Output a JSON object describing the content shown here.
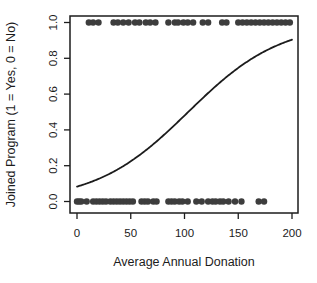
{
  "chart_data": {
    "type": "scatter",
    "title": "",
    "xlabel": "Average Annual Donation",
    "ylabel": "Joined Program (1 = Yes, 0 = No)",
    "xlim": [
      0,
      200
    ],
    "ylim": [
      0,
      1
    ],
    "grid": false,
    "legend": false,
    "x_ticks": {
      "values": [
        0,
        50,
        100,
        150,
        200
      ],
      "labels": [
        "0",
        "50",
        "100",
        "150",
        "200"
      ]
    },
    "y_ticks": {
      "values": [
        0,
        0.2,
        0.4,
        0.6,
        0.8,
        1.0
      ],
      "labels": [
        "0.0",
        "0.2",
        "0.4",
        "0.6",
        "0.8",
        "1.0"
      ]
    },
    "series": [
      {
        "name": "joined",
        "y": 1,
        "x": [
          11,
          15,
          20,
          34,
          38,
          43,
          48,
          54,
          58,
          64,
          68,
          73,
          85,
          91,
          94,
          99,
          103,
          108,
          117,
          122,
          135,
          139,
          150,
          154,
          158,
          162,
          166,
          170,
          174,
          178,
          182,
          186,
          190,
          194,
          198
        ]
      },
      {
        "name": "not_joined",
        "y": 0,
        "x": [
          0,
          2,
          4,
          9,
          15,
          18,
          21,
          24,
          27,
          31,
          34,
          37,
          40,
          43,
          46,
          49,
          52,
          60,
          63,
          66,
          71,
          74,
          85,
          88,
          91,
          95,
          98,
          103,
          111,
          116,
          122,
          126,
          129,
          133,
          136,
          141,
          147,
          153,
          169,
          174
        ]
      }
    ],
    "fit_curve": {
      "type": "logistic",
      "intercept": -2.4,
      "slope": 0.0232,
      "x_range": [
        0,
        200
      ],
      "p_at_x0": 0.08,
      "p_at_x200": 0.91
    },
    "colors": {
      "points": "#3d3d3d",
      "curve": "#1c1c1c",
      "axis": "#1c1c1c",
      "background": "#ffffff"
    }
  }
}
